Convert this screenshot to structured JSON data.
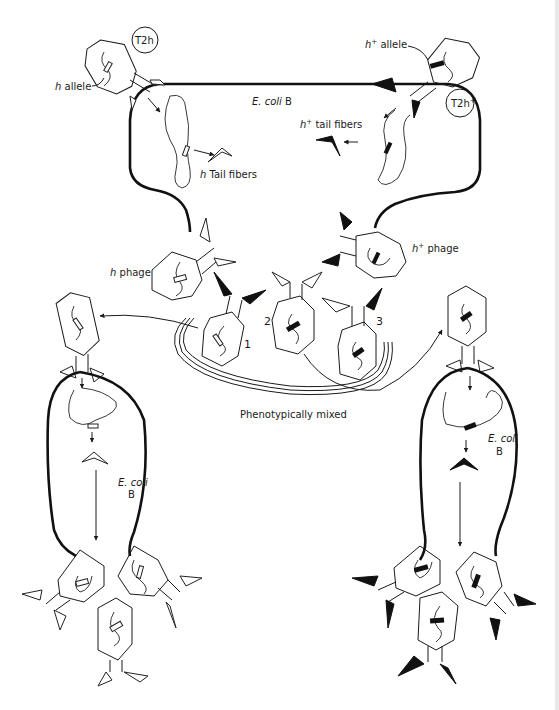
{
  "figure": {
    "labels": {
      "t2h": "T2h",
      "t2h_plus_base": "T2h",
      "plus": "+",
      "h_allele": "allele",
      "h_allele_italic": "h",
      "h_plus_allele": "allele",
      "h_plus_allele_italic": "h",
      "ecoli_top": "E. coli",
      "ecoli_top_strain": "B",
      "h_tail_fibers_italic": "h",
      "h_tail_fibers": "Tail fibers",
      "h_plus_tail_fibers_italic": "h",
      "h_plus_tail_fibers": "tail fibers",
      "h_phage_italic": "h",
      "h_phage": "phage",
      "h_plus_phage_italic": "h",
      "h_plus_phage": "phage",
      "phenotypically_mixed": "Phenotypically mixed",
      "ecoli_left": "E. coli",
      "ecoli_left_strain": "B",
      "ecoli_right": "E. coli",
      "ecoli_right_strain": "B"
    },
    "progeny_numbers": [
      "1",
      "2",
      "3"
    ],
    "colors": {
      "line": "#1a1a1a",
      "background": "#ffffff",
      "edge_strip": "#e8e8e8"
    }
  }
}
